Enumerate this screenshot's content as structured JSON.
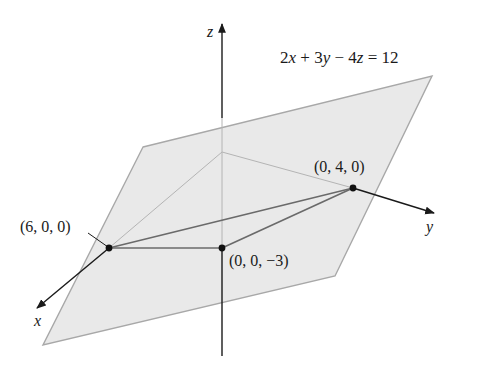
{
  "figure": {
    "equation": {
      "parts": [
        {
          "text": "2",
          "italic": false
        },
        {
          "text": "x",
          "italic": true
        },
        {
          "text": " + 3",
          "italic": false
        },
        {
          "text": "y",
          "italic": true
        },
        {
          "text": " − 4",
          "italic": false
        },
        {
          "text": "z",
          "italic": true
        },
        {
          "text": " = 12",
          "italic": false
        }
      ],
      "full": "2x + 3y − 4z = 12"
    },
    "axes": {
      "x_label": "x",
      "y_label": "y",
      "z_label": "z"
    },
    "points": [
      {
        "id": "x-intercept",
        "label": "(6, 0, 0)"
      },
      {
        "id": "y-intercept",
        "label": "(0, 4, 0)"
      },
      {
        "id": "z-intercept",
        "label": "(0, 0, −3)"
      }
    ],
    "colors": {
      "plane_fill": "#e9e9e9",
      "plane_edge": "#a8a8a8",
      "axis": "#1a1a1a",
      "triangle_edge": "#6a6a6a",
      "hidden_edge": "#b4b4b4",
      "point": "#111111"
    }
  }
}
